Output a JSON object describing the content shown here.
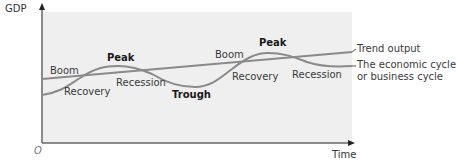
{
  "diagram": {
    "axes": {
      "y_label": "GDP",
      "x_label": "Time",
      "origin_label": "O"
    },
    "lines": [
      {
        "name": "trend",
        "label": "Trend output",
        "color": "#8a8a8a"
      },
      {
        "name": "cycle",
        "label_line1": "The economic cycle",
        "label_line2": "or business cycle",
        "color": "#8a8a8a"
      }
    ],
    "phase_labels": [
      {
        "text": "Boom",
        "bold": false
      },
      {
        "text": "Recovery",
        "bold": false
      },
      {
        "text": "Peak",
        "bold": true
      },
      {
        "text": "Recession",
        "bold": false
      },
      {
        "text": "Trough",
        "bold": true
      },
      {
        "text": "Boom",
        "bold": false
      },
      {
        "text": "Recovery",
        "bold": false
      },
      {
        "text": "Peak",
        "bold": true
      },
      {
        "text": "Recession",
        "bold": false
      }
    ],
    "colors": {
      "plot_background": "#efefef",
      "axis": "#555555",
      "curve": "#8a8a8a"
    }
  }
}
